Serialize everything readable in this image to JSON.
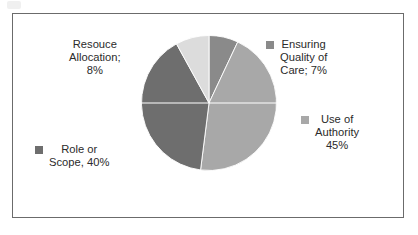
{
  "chart_data": {
    "type": "pie",
    "title": "",
    "legend_position": "around-slices",
    "grid": false,
    "categories": [
      "Ensuring Quality of Care",
      "Use of Authority",
      "Role or Scope",
      "Resouce Allocation"
    ],
    "values": [
      7,
      45,
      40,
      8
    ],
    "unit": "%",
    "colors": [
      "#8a8a8a",
      "#a8a8a8",
      "#6e6e6e",
      "#dcdcdc"
    ],
    "slices": [
      {
        "name": "Ensuring Quality of Care",
        "value": 7,
        "color": "#8a8a8a",
        "start_angle": 0,
        "end_angle": 25.2,
        "label_text": "Ensuring\nQuality of\nCare; 7%"
      },
      {
        "name": "Use of Authority",
        "value": 45,
        "color": "#a8a8a8",
        "start_angle": 25.2,
        "end_angle": 187.2,
        "label_text": "Use of\nAuthority\n45%"
      },
      {
        "name": "Role or Scope",
        "value": 40,
        "color": "#6e6e6e",
        "start_angle": 187.2,
        "end_angle": 331.2,
        "label_text": "Role or\nScope, 40%"
      },
      {
        "name": "Resouce Allocation",
        "value": 8,
        "color": "#dcdcdc",
        "start_angle": 331.2,
        "end_angle": 360,
        "label_text": "Resouce\nAllocation;\n8%"
      }
    ]
  },
  "frame": {
    "border_color": "#6b6b6b",
    "background": "#ffffff"
  }
}
